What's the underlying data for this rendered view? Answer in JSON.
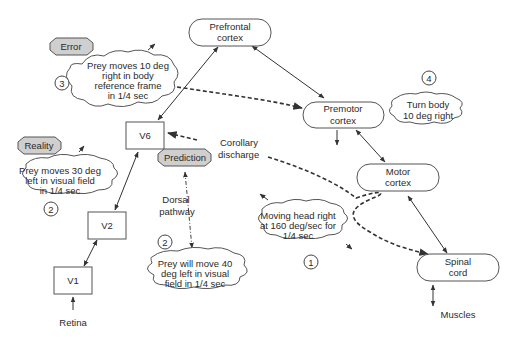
{
  "nodes": {
    "prefrontal": {
      "line1": "Prefrontal",
      "line2": "cortex"
    },
    "premotor": {
      "line1": "Premotor",
      "line2": "cortex"
    },
    "motor": {
      "line1": "Motor",
      "line2": "cortex"
    },
    "spinal": {
      "line1": "Spinal",
      "line2": "cord"
    },
    "v6": "V6",
    "v2": "V2",
    "v1": "V1"
  },
  "labels": {
    "retina": "Retina",
    "muscles": "Muscles",
    "dorsal1": "Dorsal",
    "dorsal2": "pathway",
    "corollary1": "Corollary",
    "corollary2": "discharge"
  },
  "tags": {
    "error": "Error",
    "reality": "Reality",
    "prediction": "Prediction"
  },
  "clouds": {
    "error_cloud": [
      "Prey moves 10 deg",
      "right in body",
      "reference frame",
      "in 1/4 sec"
    ],
    "reality_cloud": [
      "Prey moves 30 deg",
      "left in visual field",
      "in 1/4 sec"
    ],
    "prediction_cloud": [
      "Prey will move 40",
      "deg left in visual",
      "field in 1/4 sec"
    ],
    "head_cloud": [
      "Moving head right",
      "at 160 deg/sec for",
      "1/4 sec"
    ],
    "turn_cloud": [
      "Turn body",
      "10 deg right"
    ]
  },
  "steps": {
    "s1": "1",
    "s2a": "2",
    "s2b": "2",
    "s3": "3",
    "s4": "4"
  }
}
